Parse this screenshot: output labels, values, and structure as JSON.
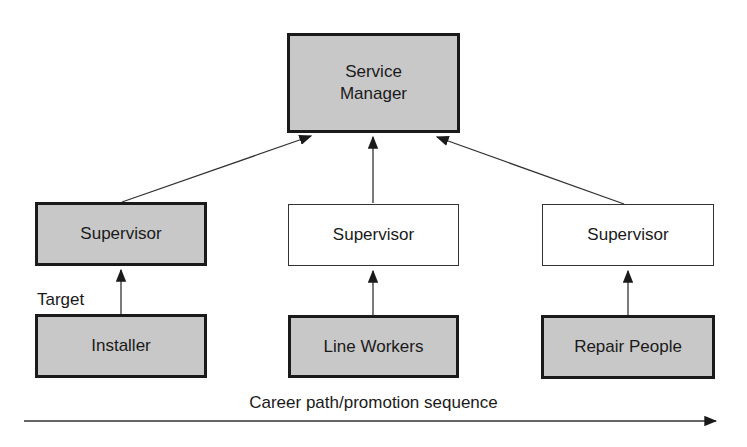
{
  "diagram": {
    "nodes": {
      "service_manager": {
        "label_line1": "Service",
        "label_line2": "Manager",
        "shaded": true
      },
      "supervisor_left": {
        "label": "Supervisor",
        "shaded": true
      },
      "supervisor_middle": {
        "label": "Supervisor",
        "shaded": false
      },
      "supervisor_right": {
        "label": "Supervisor",
        "shaded": false
      },
      "installer": {
        "label": "Installer",
        "shaded": true
      },
      "line_workers": {
        "label": "Line Workers",
        "shaded": true
      },
      "repair_people": {
        "label": "Repair People",
        "shaded": true
      }
    },
    "annotations": {
      "target": "Target",
      "axis": "Career path/promotion sequence"
    },
    "colors": {
      "shaded_fill": "#c8c8c8",
      "stroke": "#1a1a1a"
    }
  }
}
